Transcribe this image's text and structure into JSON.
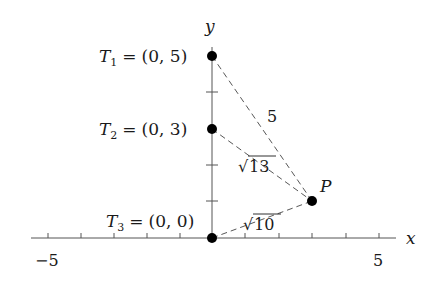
{
  "diagram": {
    "title": "",
    "axes": {
      "x_label": "x",
      "y_label": "y",
      "x_tick_labels": [
        {
          "value": -5,
          "label": "−5"
        },
        {
          "value": 5,
          "label": "5"
        }
      ],
      "x_range": [
        -5.5,
        5.5
      ],
      "y_range": [
        0,
        5.5
      ],
      "x_ticks": [
        -5,
        -4,
        -3,
        -2,
        -1,
        1,
        2,
        3,
        4,
        5
      ],
      "y_ticks": [
        1,
        2,
        3,
        4,
        5
      ]
    },
    "points": [
      {
        "id": "T1",
        "name": "T",
        "sub": "1",
        "coords": "(0, 5)",
        "x": 0,
        "y": 5
      },
      {
        "id": "T2",
        "name": "T",
        "sub": "2",
        "coords": "(0, 3)",
        "x": 0,
        "y": 3
      },
      {
        "id": "T3",
        "name": "T",
        "sub": "3",
        "coords": "(0, 0)",
        "x": 0,
        "y": 0
      },
      {
        "id": "P",
        "name": "P",
        "x": 3,
        "y": 1
      }
    ],
    "segments": [
      {
        "from": "T1",
        "to": "P",
        "label": "5"
      },
      {
        "from": "T2",
        "to": "P",
        "label": "√13",
        "radicand": "13"
      },
      {
        "from": "T3",
        "to": "P",
        "label": "√10",
        "radicand": "10"
      }
    ],
    "labels": {
      "eq": "=",
      "P": "P",
      "sqrt_sign": "√"
    }
  }
}
